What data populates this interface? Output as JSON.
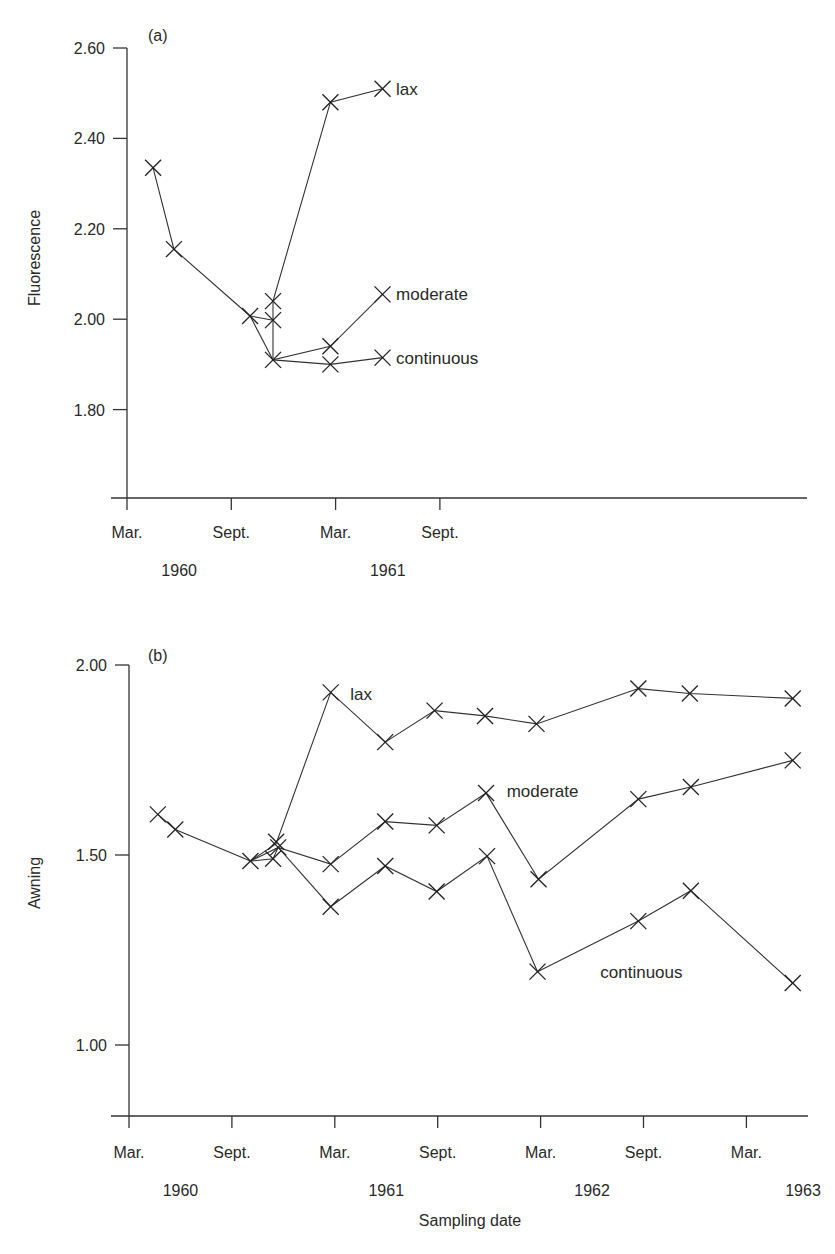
{
  "figure": {
    "xlabel": "Sampling date"
  },
  "chart_data": [
    {
      "type": "line",
      "panel_label": "(a)",
      "ylabel": "Fluorescence",
      "xlabel": "",
      "ylim": [
        1.6,
        2.6
      ],
      "yticks": [
        "2.60",
        "2.40",
        "2.20",
        "2.00",
        "1.80"
      ],
      "ytick_values": [
        2.6,
        2.4,
        2.2,
        2.0,
        1.8
      ],
      "xticks": [
        "Mar.",
        "Sept.",
        "Mar.",
        "Sept."
      ],
      "year_labels": [
        {
          "label": "1960",
          "at": 0.5
        },
        {
          "label": "1961",
          "at": 2.5
        }
      ],
      "x_unit": "half-years from Mar. 1960",
      "xlim": [
        0,
        6.6
      ],
      "grid": false,
      "legend": "inline labels at line ends",
      "series": [
        {
          "name": "shared",
          "x": [
            0.25,
            0.45,
            1.18
          ],
          "y": [
            2.335,
            2.155,
            2.007
          ]
        },
        {
          "name": "lax",
          "x": [
            1.18,
            1.4,
            1.95,
            2.45
          ],
          "y": [
            2.007,
            2.04,
            2.48,
            2.51
          ],
          "label_at": [
            2.58,
            2.51
          ]
        },
        {
          "name": "moderate",
          "x": [
            1.18,
            1.4,
            1.4,
            1.95,
            2.45
          ],
          "y": [
            2.007,
            1.998,
            1.998,
            1.94,
            2.055
          ],
          "label_at": [
            2.58,
            2.055
          ]
        },
        {
          "name": "continuous",
          "x": [
            1.18,
            1.4,
            1.95,
            2.45
          ],
          "y": [
            2.007,
            1.91,
            1.9,
            1.915
          ],
          "label_at": [
            2.58,
            1.915
          ]
        }
      ],
      "paths": [
        {
          "name": "shared",
          "pts": [
            [
              0.25,
              2.335
            ],
            [
              0.45,
              2.155
            ],
            [
              1.18,
              2.007
            ]
          ]
        },
        {
          "name": "lax",
          "pts": [
            [
              1.4,
              1.998
            ],
            [
              1.4,
              2.04
            ],
            [
              1.95,
              2.48
            ],
            [
              2.45,
              2.51
            ]
          ]
        },
        {
          "name": "moderate",
          "pts": [
            [
              1.18,
              2.007
            ],
            [
              1.4,
              1.998
            ],
            [
              1.4,
              1.91
            ],
            [
              1.95,
              1.94
            ],
            [
              2.45,
              2.055
            ]
          ]
        },
        {
          "name": "continuous",
          "pts": [
            [
              1.18,
              2.007
            ],
            [
              1.4,
              1.91
            ],
            [
              1.95,
              1.9
            ],
            [
              2.45,
              1.915
            ]
          ]
        }
      ],
      "markers": [
        [
          0.25,
          2.335
        ],
        [
          0.45,
          2.155
        ],
        [
          1.18,
          2.007
        ],
        [
          1.4,
          2.04
        ],
        [
          1.4,
          1.998
        ],
        [
          1.4,
          1.91
        ],
        [
          1.95,
          2.48
        ],
        [
          1.95,
          1.94
        ],
        [
          1.95,
          1.9
        ],
        [
          2.45,
          2.51
        ],
        [
          2.45,
          2.055
        ],
        [
          2.45,
          1.915
        ]
      ],
      "labels": [
        {
          "text": "lax",
          "x": 2.58,
          "y": 2.51
        },
        {
          "text": "moderate",
          "x": 2.58,
          "y": 2.055
        },
        {
          "text": "continuous",
          "x": 2.58,
          "y": 1.915
        }
      ]
    },
    {
      "type": "line",
      "panel_label": "(b)",
      "ylabel": "Awning",
      "xlabel": "Sampling date",
      "ylim": [
        0.8,
        2.0
      ],
      "yticks": [
        "2.00",
        "1.50",
        "1.00"
      ],
      "ytick_values": [
        2.0,
        1.5,
        1.0
      ],
      "xticks": [
        "Mar.",
        "Sept.",
        "Mar.",
        "Sept.",
        "Mar.",
        "Sept.",
        "Mar."
      ],
      "year_labels": [
        {
          "label": "1960",
          "at": 0.5
        },
        {
          "label": "1961",
          "at": 2.5
        },
        {
          "label": "1962",
          "at": 4.5
        },
        {
          "label": "1963",
          "at": 6.55
        }
      ],
      "x_unit": "half-years from Mar. 1960",
      "xlim": [
        0,
        6.6
      ],
      "grid": false,
      "legend": "inline labels",
      "series": [
        {
          "name": "shared",
          "x": [
            0.28,
            0.45,
            1.18
          ],
          "y": [
            1.607,
            1.567,
            1.484
          ]
        },
        {
          "name": "lax",
          "x": [
            1.18,
            1.43,
            1.96,
            2.49,
            2.97,
            3.46,
            3.96,
            4.95,
            5.45,
            6.45
          ],
          "y": [
            1.484,
            1.53,
            1.928,
            1.797,
            1.88,
            1.866,
            1.845,
            1.938,
            1.925,
            1.912
          ]
        },
        {
          "name": "moderate",
          "x": [
            1.18,
            1.4,
            1.96,
            2.49,
            2.99,
            3.47,
            3.98,
            4.95,
            5.46,
            6.45
          ],
          "y": [
            1.484,
            1.49,
            1.476,
            1.588,
            1.578,
            1.663,
            1.436,
            1.647,
            1.679,
            1.749
          ]
        },
        {
          "name": "continuous",
          "x": [
            1.18,
            1.45,
            1.96,
            2.49,
            2.99,
            3.48,
            3.97,
            4.95,
            5.46,
            6.45
          ],
          "y": [
            1.484,
            1.52,
            1.364,
            1.471,
            1.404,
            1.497,
            1.193,
            1.326,
            1.406,
            1.163
          ]
        }
      ],
      "paths": [
        {
          "name": "shared",
          "pts": [
            [
              0.28,
              1.607
            ],
            [
              0.45,
              1.567
            ],
            [
              1.18,
              1.484
            ]
          ]
        },
        {
          "name": "lax",
          "pts": [
            [
              1.18,
              1.484
            ],
            [
              1.43,
              1.53
            ],
            [
              1.96,
              1.928
            ],
            [
              2.49,
              1.797
            ],
            [
              2.97,
              1.88
            ],
            [
              3.46,
              1.866
            ],
            [
              3.96,
              1.845
            ],
            [
              4.95,
              1.938
            ],
            [
              5.45,
              1.925
            ],
            [
              6.45,
              1.912
            ]
          ]
        },
        {
          "name": "moderate",
          "pts": [
            [
              1.18,
              1.484
            ],
            [
              1.4,
              1.49
            ],
            [
              1.45,
              1.52
            ],
            [
              1.96,
              1.476
            ],
            [
              2.49,
              1.588
            ],
            [
              2.99,
              1.578
            ],
            [
              3.47,
              1.663
            ],
            [
              3.98,
              1.436
            ],
            [
              4.95,
              1.647
            ],
            [
              5.46,
              1.679
            ],
            [
              6.45,
              1.749
            ]
          ]
        },
        {
          "name": "continuous",
          "pts": [
            [
              1.18,
              1.484
            ],
            [
              1.45,
              1.52
            ],
            [
              1.96,
              1.364
            ],
            [
              2.49,
              1.471
            ],
            [
              2.99,
              1.404
            ],
            [
              3.48,
              1.497
            ],
            [
              3.97,
              1.193
            ],
            [
              4.95,
              1.326
            ],
            [
              5.46,
              1.406
            ],
            [
              6.45,
              1.163
            ]
          ]
        }
      ],
      "markers": [
        [
          0.28,
          1.607
        ],
        [
          0.45,
          1.567
        ],
        [
          1.18,
          1.484
        ],
        [
          1.43,
          1.535
        ],
        [
          1.4,
          1.49
        ],
        [
          1.45,
          1.52
        ],
        [
          1.96,
          1.928
        ],
        [
          2.49,
          1.797
        ],
        [
          2.97,
          1.88
        ],
        [
          3.46,
          1.866
        ],
        [
          3.96,
          1.845
        ],
        [
          4.95,
          1.938
        ],
        [
          5.45,
          1.925
        ],
        [
          6.45,
          1.912
        ],
        [
          1.96,
          1.476
        ],
        [
          2.49,
          1.588
        ],
        [
          2.99,
          1.578
        ],
        [
          3.47,
          1.663
        ],
        [
          3.98,
          1.436
        ],
        [
          4.95,
          1.647
        ],
        [
          5.46,
          1.679
        ],
        [
          6.45,
          1.749
        ],
        [
          1.96,
          1.364
        ],
        [
          2.49,
          1.471
        ],
        [
          2.99,
          1.404
        ],
        [
          3.48,
          1.497
        ],
        [
          3.97,
          1.193
        ],
        [
          4.95,
          1.326
        ],
        [
          5.46,
          1.406
        ],
        [
          6.45,
          1.163
        ]
      ],
      "labels": [
        {
          "text": "lax",
          "x": 2.15,
          "y": 1.925
        },
        {
          "text": "moderate",
          "x": 3.67,
          "y": 1.668
        },
        {
          "text": "continuous",
          "x": 4.58,
          "y": 1.193
        }
      ]
    }
  ]
}
